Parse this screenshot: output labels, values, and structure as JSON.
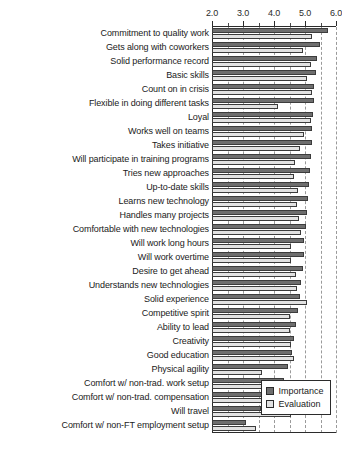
{
  "chart_data": {
    "type": "bar",
    "orientation": "horizontal",
    "title": "",
    "subtitle": "",
    "xlabel": "",
    "ylabel": "",
    "xlim": [
      2.0,
      6.0
    ],
    "xticks": [
      2.0,
      3.0,
      4.0,
      5.0,
      6.0
    ],
    "xtick_labels": [
      "2.0",
      "3.0",
      "4.0",
      "5.0",
      "6.0"
    ],
    "minor_ticks": [
      2.5,
      3.5,
      4.5,
      5.5
    ],
    "grid": "vertical dashed gridlines at 2.5, 3.0, 3.5, 4.0, 4.5, 5.0, 5.5, 6.0",
    "axis_position": "top",
    "legend_position": "bottom-right",
    "categories": [
      "Commitment to quality work",
      "Gets along with coworkers",
      "Solid performance record",
      "Basic skills",
      "Count on in crisis",
      "Flexible in doing different tasks",
      "Loyal",
      "Works well on teams",
      "Takes initiative",
      "Will participate in training programs",
      "Tries new approaches",
      "Up-to-date skills",
      "Learns new technology",
      "Handles many projects",
      "Comfortable with new technologies",
      "Will work long hours",
      "Will work overtime",
      "Desire to get ahead",
      "Understands new technologies",
      "Solid experience",
      "Competitive spirit",
      "Ability to lead",
      "Creativity",
      "Good education",
      "Physical agility",
      "Comfort w/ non-trad. work setup",
      "Comfort w/ non-trad. compensation",
      "Will travel",
      "Comfort w/ non-FT employment setup"
    ],
    "series": [
      {
        "name": "Importance",
        "color": "#6e6e6e",
        "values": [
          5.74,
          5.48,
          5.38,
          5.34,
          5.3,
          5.28,
          5.26,
          5.24,
          5.22,
          5.2,
          5.16,
          5.14,
          5.1,
          5.06,
          5.02,
          4.98,
          4.96,
          4.92,
          4.88,
          4.84,
          4.78,
          4.72,
          4.66,
          4.58,
          4.46,
          4.32,
          4.24,
          3.58,
          3.1
        ]
      },
      {
        "name": "Evaluation",
        "color": "#e2e2e2",
        "values": [
          5.24,
          4.92,
          5.2,
          5.06,
          5.22,
          4.12,
          5.2,
          4.96,
          4.84,
          4.68,
          4.66,
          4.78,
          4.74,
          4.82,
          4.86,
          4.56,
          4.54,
          4.7,
          4.74,
          5.08,
          4.52,
          4.5,
          4.56,
          4.64,
          3.62,
          4.26,
          4.2,
          4.56,
          3.42
        ]
      }
    ]
  },
  "legend": {
    "items": [
      {
        "label": "Importance"
      },
      {
        "label": "Evaluation"
      }
    ]
  },
  "colors": {
    "importance": "#6e6e6e",
    "evaluation": "#e2e2e2",
    "axis": "#2b2b2b",
    "grid": "#9a9a9a",
    "background": "#ffffff"
  }
}
